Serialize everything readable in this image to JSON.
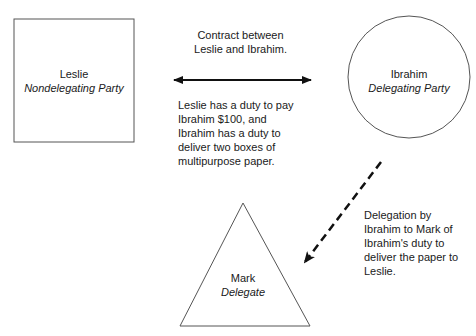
{
  "nodes": {
    "leslie": {
      "name": "Leslie",
      "role": "Nondelegating Party",
      "shape": "square"
    },
    "ibrahim": {
      "name": "Ibrahim",
      "role": "Delegating Party",
      "shape": "circle"
    },
    "mark": {
      "name": "Mark",
      "role": "Delegate",
      "shape": "triangle"
    }
  },
  "edges": {
    "contract": {
      "from": "leslie",
      "to": "ibrahim",
      "style": "solid-double-arrow",
      "title": "Contract between Leslie and Ibrahim.",
      "description": "Leslie has a duty to pay Ibrahim $100, and Ibrahim has a duty to deliver two boxes of multipurpose paper."
    },
    "delegation": {
      "from": "ibrahim",
      "to": "mark",
      "style": "dashed-arrow",
      "description": "Delegation by Ibrahim to Mark of Ibrahim's duty to deliver the paper to Leslie."
    }
  },
  "colors": {
    "stroke": "#333333",
    "arrow": "#111111",
    "text": "#1a1a1a",
    "background": "#ffffff"
  }
}
